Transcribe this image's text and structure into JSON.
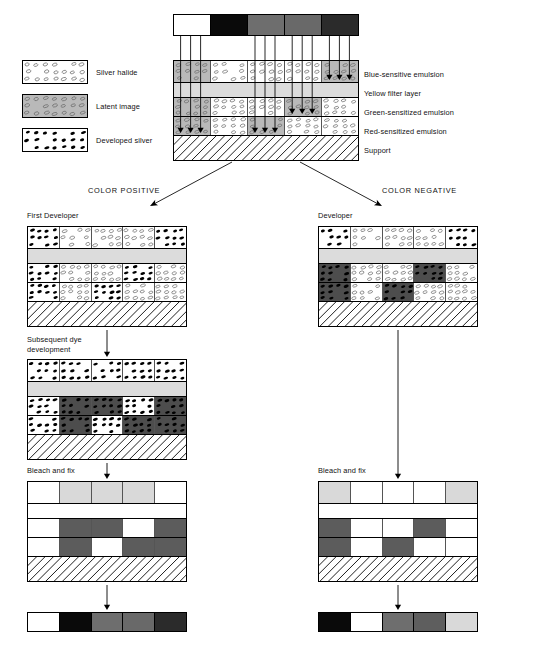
{
  "diagram": {
    "legend": {
      "items": [
        {
          "key": "silver-halide",
          "label": "Silver halide",
          "fill": "#ffffff",
          "grain": "open"
        },
        {
          "key": "latent-image",
          "label": "Latent image",
          "fill": "#b9b9b9",
          "grain": "open"
        },
        {
          "key": "developed-silver",
          "label": "Developed silver",
          "fill": "#ffffff",
          "grain": "solid"
        }
      ]
    },
    "layer_labels": [
      "Blue-sensitive emulsion",
      "Yellow filter layer",
      "Green-sensitized emulsion",
      "Red-sensitized emulsion",
      "Support"
    ],
    "branch_labels": {
      "left": "COLOR POSITIVE",
      "right": "COLOR NEGATIVE"
    },
    "step_labels": {
      "first_developer": "First Developer",
      "subsequent_dye": "Subsequent dye\ndevelopment",
      "developer": "Developer",
      "bleach_fix_left": "Bleach and fix",
      "bleach_fix_right": "Bleach and fix"
    },
    "colors": {
      "white": "#ffffff",
      "black": "#0a0a0a",
      "mid_gray": "#6e6e6e",
      "dark_gray": "#3a3a3a",
      "light_gray": "#d9d9d9",
      "latent_gray": "#b9b9b9",
      "dye_gray": "#4d4d4d",
      "yellow_filter": "#dcdcdc",
      "outline": "#000000"
    },
    "exposure_bar": {
      "name": "original subject tone scale",
      "segments": [
        "#ffffff",
        "#0a0a0a",
        "#6e6e6e",
        "#696969",
        "#2b2b2b"
      ],
      "segment_names": [
        "white",
        "black",
        "gray",
        "gray",
        "dark gray"
      ]
    },
    "exposed_film": {
      "name": "exposed film cross-section",
      "rows": [
        {
          "layer": "Blue-sensitive emulsion",
          "cells": [
            "latent",
            "halide",
            "halide",
            "halide",
            "latent"
          ],
          "arrows": [
            false,
            false,
            false,
            false,
            true
          ]
        },
        {
          "layer": "Yellow filter layer",
          "cells": [
            "filter"
          ],
          "arrows": []
        },
        {
          "layer": "Green-sensitized emulsion",
          "cells": [
            "latent",
            "halide",
            "halide",
            "latent",
            "halide"
          ],
          "arrows": [
            false,
            false,
            false,
            true,
            false
          ]
        },
        {
          "layer": "Red-sensitized emulsion",
          "cells": [
            "latent",
            "halide",
            "latent",
            "halide",
            "halide"
          ],
          "arrows": [
            true,
            false,
            true,
            false,
            false
          ]
        },
        {
          "layer": "Support",
          "cells": [
            "support"
          ],
          "arrows": []
        }
      ],
      "ray_groups": [
        {
          "from_segment": 1,
          "to_layer": "Red-sensitized emulsion"
        },
        {
          "from_segment": 3,
          "to_layer": "Red-sensitized emulsion"
        },
        {
          "from_segment": 4,
          "to_layer": "Green-sensitized emulsion"
        },
        {
          "from_segment": 5,
          "to_layer": "Blue-sensitive emulsion"
        }
      ]
    },
    "positive": {
      "first_developer": {
        "rows": [
          {
            "layer": "Blue-sensitive emulsion",
            "cells": [
              "dev",
              "halide",
              "halide",
              "halide",
              "dev"
            ]
          },
          {
            "layer": "Yellow filter layer",
            "cells": [
              "filter"
            ]
          },
          {
            "layer": "Green-sensitized emulsion",
            "cells": [
              "dev",
              "halide",
              "halide",
              "dev",
              "halide"
            ]
          },
          {
            "layer": "Red-sensitized emulsion",
            "cells": [
              "dev",
              "halide",
              "dev",
              "halide",
              "halide"
            ]
          },
          {
            "layer": "Support",
            "cells": [
              "support"
            ]
          }
        ]
      },
      "subsequent_dye": {
        "rows": [
          {
            "layer": "Blue-sensitive emulsion",
            "cells": [
              "dev",
              "dev",
              "dev",
              "dev",
              "dev"
            ]
          },
          {
            "layer": "Yellow filter layer",
            "cells": [
              "filter"
            ]
          },
          {
            "layer": "Green-sensitized emulsion",
            "cells": [
              "dev",
              "devdark",
              "devdark",
              "dev",
              "devdark"
            ]
          },
          {
            "layer": "Red-sensitized emulsion",
            "cells": [
              "dev",
              "devdark",
              "dev",
              "devdark",
              "devdark"
            ]
          },
          {
            "layer": "Support",
            "cells": [
              "support"
            ]
          }
        ]
      },
      "bleach_fix": {
        "rows": [
          {
            "layer": "Blue-sensitive emulsion",
            "cells": [
              "white",
              "light",
              "light",
              "light",
              "white"
            ]
          },
          {
            "layer": "Yellow filter layer",
            "cells": [
              "white"
            ]
          },
          {
            "layer": "Green-sensitized emulsion",
            "cells": [
              "white",
              "gray",
              "gray",
              "white",
              "gray"
            ]
          },
          {
            "layer": "Red-sensitized emulsion",
            "cells": [
              "white",
              "gray",
              "white",
              "gray",
              "gray"
            ]
          },
          {
            "layer": "Support",
            "cells": [
              "support"
            ]
          }
        ]
      },
      "result_bar": {
        "name": "positive tone scale result",
        "segments": [
          "#ffffff",
          "#0a0a0a",
          "#6e6e6e",
          "#696969",
          "#2b2b2b"
        ],
        "segment_names": [
          "white",
          "black",
          "gray",
          "gray",
          "dark gray"
        ]
      }
    },
    "negative": {
      "developer": {
        "rows": [
          {
            "layer": "Blue-sensitive emulsion",
            "cells": [
              "dev",
              "halide",
              "halide",
              "halide",
              "dev"
            ]
          },
          {
            "layer": "Yellow filter layer",
            "cells": [
              "filter"
            ]
          },
          {
            "layer": "Green-sensitized emulsion",
            "cells": [
              "devdark",
              "halide",
              "halide",
              "devdark",
              "halide"
            ]
          },
          {
            "layer": "Red-sensitized emulsion",
            "cells": [
              "devdark",
              "halide",
              "devdark",
              "halide",
              "halide"
            ]
          },
          {
            "layer": "Support",
            "cells": [
              "support"
            ]
          }
        ]
      },
      "bleach_fix": {
        "rows": [
          {
            "layer": "Blue-sensitive emulsion",
            "cells": [
              "light",
              "white",
              "white",
              "white",
              "light"
            ]
          },
          {
            "layer": "Yellow filter layer",
            "cells": [
              "white"
            ]
          },
          {
            "layer": "Green-sensitized emulsion",
            "cells": [
              "gray",
              "white",
              "white",
              "gray",
              "white"
            ]
          },
          {
            "layer": "Red-sensitized emulsion",
            "cells": [
              "gray",
              "white",
              "gray",
              "white",
              "white"
            ]
          },
          {
            "layer": "Support",
            "cells": [
              "support"
            ]
          }
        ]
      },
      "result_bar": {
        "name": "negative tone scale result",
        "segments": [
          "#0a0a0a",
          "#ffffff",
          "#6e6e6e",
          "#5e5e5e",
          "#d9d9d9"
        ],
        "segment_names": [
          "black",
          "white",
          "gray",
          "gray",
          "light gray"
        ]
      }
    }
  }
}
